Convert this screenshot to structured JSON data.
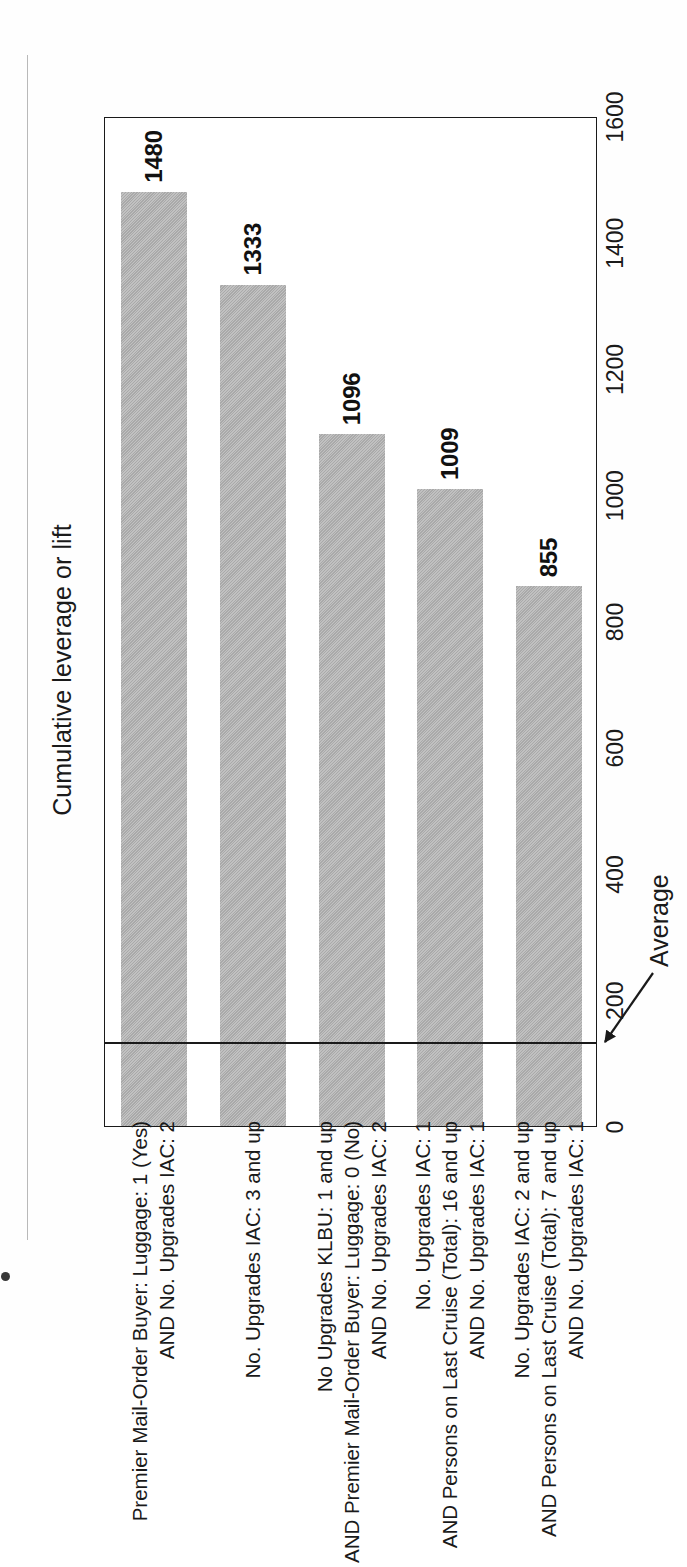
{
  "figure": {
    "axis_title": "Cumulative leverage or lift",
    "average_label": "Average"
  },
  "chart_data": {
    "type": "bar",
    "orientation": "horizontal",
    "title": "",
    "xlabel": "Cumulative leverage or lift",
    "ylabel": "",
    "xlim": [
      0,
      1600
    ],
    "xticks": [
      0,
      200,
      400,
      600,
      800,
      1000,
      1200,
      1400,
      1600
    ],
    "tick_labels": [
      "0",
      "200",
      "400",
      "600",
      "800",
      "1000",
      "1200",
      "1400",
      "1600"
    ],
    "grid": false,
    "legend": false,
    "bar_color": "#b4b4b4",
    "categories": [
      "Premier Mail-Order Buyer: Luggage: 1 (Yes)\nAND No. Upgrades IAC: 2",
      "No. Upgrades IAC: 3 and up",
      "No Upgrades KLBU: 1 and up\nAND Premier Mail-Order Buyer: Luggage: 0 (No)\nAND No. Upgrades IAC: 2",
      "No. Upgrades IAC: 1\nAND Persons on Last Cruise (Total): 16 and up\nAND No. Upgrades IAC: 1",
      "No. Upgrades IAC: 2 and up\nAND Persons on Last Cruise (Total): 7 and up\nAND No. Upgrades IAC: 1"
    ],
    "values": [
      1480,
      1333,
      1096,
      1009,
      855
    ],
    "data_labels": [
      "1480",
      "1333",
      "1096",
      "1009",
      "855"
    ],
    "reference_line": {
      "label": "Average",
      "value": 130
    }
  }
}
